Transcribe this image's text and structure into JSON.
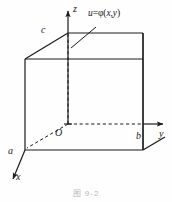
{
  "figure": {
    "caption": "图 9-2",
    "background_color": "#fefefe",
    "stroke_color": "#1a1a1a",
    "labels": {
      "axis_z": "z",
      "axis_y": "y",
      "axis_x": "x",
      "vertex_a": "a",
      "vertex_b": "b",
      "vertex_c": "c",
      "origin": "O",
      "surface_equation_lhs": "u",
      "surface_equation_eq": "=",
      "surface_equation_fn": "φ",
      "surface_equation_open": "(",
      "surface_equation_var_x": "x",
      "surface_equation_comma": ",",
      "surface_equation_var_y": "y",
      "surface_equation_close": ")"
    },
    "geometry": {
      "description": "rectangular box in 3D cartesian axes",
      "origin_point": [
        68,
        124
      ],
      "axis_z_tip": [
        68,
        8
      ],
      "axis_y_tip": [
        168,
        124
      ],
      "axis_x_tip": [
        12,
        182
      ],
      "vertex_c": [
        68,
        33
      ],
      "vertex_b": [
        143,
        124
      ],
      "vertex_a": [
        25,
        150
      ],
      "box_top_front_left": [
        25,
        59
      ],
      "box_top_front_right": [
        143,
        59
      ],
      "box_top_back_right": [
        143,
        33
      ],
      "box_bottom_front_left": [
        25,
        150
      ],
      "box_bottom_front_right": [
        143,
        150
      ],
      "leader_line_start": [
        96,
        27
      ],
      "leader_line_end": [
        72,
        48
      ]
    }
  }
}
